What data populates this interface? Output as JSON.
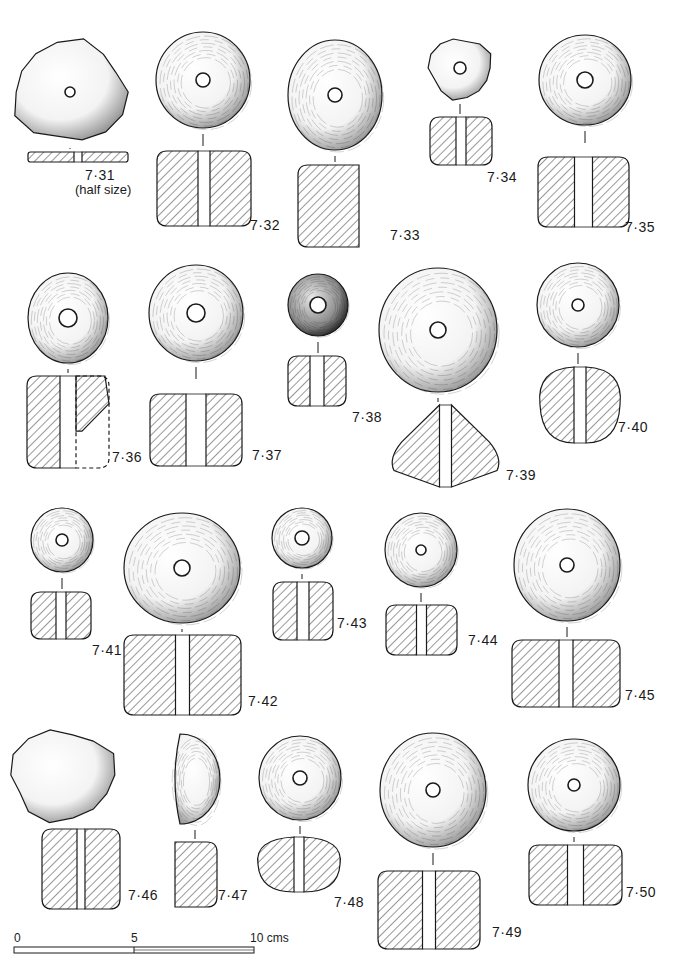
{
  "figure": {
    "ink_color": "#1a1a1a",
    "paper_color": "#ffffff"
  },
  "objects": [
    {
      "id": "7·31",
      "note": "(half size)",
      "plan": {
        "cx": 70,
        "cy": 92,
        "rx": 56,
        "ry": 50,
        "hole": 5,
        "shape": "irregular"
      },
      "section": {
        "x": 28,
        "y": 152,
        "w": 100,
        "h": 10,
        "bore": 8
      },
      "label": {
        "x": 85,
        "y": 178
      },
      "note_pos": {
        "x": 75,
        "y": 192
      }
    },
    {
      "id": "7·32",
      "plan": {
        "cx": 203,
        "cy": 80,
        "rx": 47,
        "ry": 48,
        "hole": 7
      },
      "section": {
        "x": 157,
        "y": 151,
        "w": 94,
        "h": 75,
        "bore": 12
      },
      "label": {
        "x": 250,
        "y": 228
      }
    },
    {
      "id": "7·33",
      "plan": {
        "cx": 335,
        "cy": 95,
        "rx": 47,
        "ry": 55,
        "hole": 7
      },
      "section": {
        "x": 298,
        "y": 165,
        "w": 75,
        "h": 82,
        "bore": 14,
        "half": true
      },
      "label": {
        "x": 390,
        "y": 238
      }
    },
    {
      "id": "7·34",
      "plan": {
        "cx": 460,
        "cy": 68,
        "rx": 31,
        "ry": 30,
        "hole": 6,
        "shape": "irregular"
      },
      "section": {
        "x": 430,
        "y": 117,
        "w": 62,
        "h": 48,
        "bore": 10
      },
      "label": {
        "x": 487,
        "y": 180
      }
    },
    {
      "id": "7·35",
      "plan": {
        "cx": 585,
        "cy": 80,
        "rx": 46,
        "ry": 45,
        "hole": 8
      },
      "section": {
        "x": 538,
        "y": 157,
        "w": 91,
        "h": 70,
        "bore": 18
      },
      "label": {
        "x": 625,
        "y": 230
      }
    },
    {
      "id": "7·36",
      "plan": {
        "cx": 68,
        "cy": 318,
        "rx": 40,
        "ry": 45,
        "hole": 9
      },
      "section": {
        "x": 27,
        "y": 376,
        "w": 82,
        "h": 92,
        "bore": 16,
        "dashed_right": true
      },
      "label": {
        "x": 112,
        "y": 460
      }
    },
    {
      "id": "7·37",
      "plan": {
        "cx": 196,
        "cy": 313,
        "rx": 47,
        "ry": 48,
        "hole": 9
      },
      "section": {
        "x": 150,
        "y": 394,
        "w": 92,
        "h": 72,
        "bore": 20
      },
      "label": {
        "x": 252,
        "y": 458
      }
    },
    {
      "id": "7·38",
      "plan": {
        "cx": 318,
        "cy": 305,
        "rx": 30,
        "ry": 31,
        "hole": 8,
        "dark": true
      },
      "section": {
        "x": 288,
        "y": 356,
        "w": 58,
        "h": 50,
        "bore": 14
      },
      "label": {
        "x": 352,
        "y": 420
      }
    },
    {
      "id": "7·39",
      "plan": {
        "cx": 438,
        "cy": 330,
        "rx": 59,
        "ry": 62,
        "hole": 8
      },
      "section": {
        "x": 388,
        "y": 405,
        "w": 115,
        "h": 82,
        "bore": 12,
        "diamond": true
      },
      "label": {
        "x": 506,
        "y": 478
      }
    },
    {
      "id": "7·40",
      "plan": {
        "cx": 578,
        "cy": 305,
        "rx": 41,
        "ry": 42,
        "hole": 6
      },
      "section": {
        "x": 540,
        "y": 367,
        "w": 80,
        "h": 76,
        "bore": 12,
        "round": true
      },
      "label": {
        "x": 618,
        "y": 430
      }
    },
    {
      "id": "7·41",
      "plan": {
        "cx": 62,
        "cy": 540,
        "rx": 31,
        "ry": 32,
        "hole": 6
      },
      "section": {
        "x": 31,
        "y": 592,
        "w": 60,
        "h": 47,
        "bore": 10
      },
      "label": {
        "x": 92,
        "y": 653
      }
    },
    {
      "id": "7·42",
      "plan": {
        "cx": 182,
        "cy": 568,
        "rx": 58,
        "ry": 55,
        "hole": 8
      },
      "section": {
        "x": 124,
        "y": 635,
        "w": 117,
        "h": 80,
        "bore": 14
      },
      "label": {
        "x": 248,
        "y": 704
      }
    },
    {
      "id": "7·43",
      "plan": {
        "cx": 302,
        "cy": 538,
        "rx": 30,
        "ry": 30,
        "hole": 7
      },
      "section": {
        "x": 273,
        "y": 582,
        "w": 60,
        "h": 58,
        "bore": 12
      },
      "label": {
        "x": 337,
        "y": 626
      }
    },
    {
      "id": "7·44",
      "plan": {
        "cx": 421,
        "cy": 550,
        "rx": 36,
        "ry": 37,
        "hole": 5
      },
      "section": {
        "x": 386,
        "y": 605,
        "w": 71,
        "h": 50,
        "bore": 10
      },
      "label": {
        "x": 468,
        "y": 643
      }
    },
    {
      "id": "7·45",
      "plan": {
        "cx": 567,
        "cy": 565,
        "rx": 53,
        "ry": 56,
        "hole": 7
      },
      "section": {
        "x": 512,
        "y": 640,
        "w": 108,
        "h": 67,
        "bore": 14
      },
      "label": {
        "x": 625,
        "y": 698
      }
    },
    {
      "id": "7·46",
      "plan": {
        "cx": 62,
        "cy": 775,
        "rx": 52,
        "ry": 45,
        "hole": 0,
        "shape": "fragment"
      },
      "section": {
        "x": 42,
        "y": 829,
        "w": 78,
        "h": 80,
        "bore": 8
      },
      "label": {
        "x": 128,
        "y": 898
      }
    },
    {
      "id": "7·47",
      "plan": {
        "cx": 195,
        "cy": 779,
        "rx": 25,
        "ry": 45,
        "hole": 0,
        "shape": "half"
      },
      "section": {
        "x": 175,
        "y": 842,
        "w": 42,
        "h": 65,
        "bore": 0,
        "half": true
      },
      "label": {
        "x": 218,
        "y": 898
      }
    },
    {
      "id": "7·48",
      "plan": {
        "cx": 300,
        "cy": 778,
        "rx": 41,
        "ry": 42,
        "hole": 7
      },
      "section": {
        "x": 258,
        "y": 837,
        "w": 82,
        "h": 55,
        "bore": 10,
        "round": true
      },
      "label": {
        "x": 334,
        "y": 905
      }
    },
    {
      "id": "7·49",
      "plan": {
        "cx": 433,
        "cy": 790,
        "rx": 53,
        "ry": 57,
        "hole": 7
      },
      "section": {
        "x": 378,
        "y": 871,
        "w": 102,
        "h": 78,
        "bore": 13
      },
      "label": {
        "x": 492,
        "y": 935
      }
    },
    {
      "id": "7·50",
      "plan": {
        "cx": 574,
        "cy": 785,
        "rx": 46,
        "ry": 46,
        "hole": 6
      },
      "section": {
        "x": 529,
        "y": 845,
        "w": 93,
        "h": 60,
        "bore": 16,
        "pinched": true
      },
      "label": {
        "x": 626,
        "y": 895
      }
    }
  ],
  "scale_bar": {
    "x": 14,
    "y": 947,
    "width": 240,
    "height": 6,
    "ticks": [
      {
        "label": "0",
        "x": 14
      },
      {
        "label": "5",
        "x": 131
      },
      {
        "label": "10 cms",
        "x": 250
      }
    ]
  }
}
